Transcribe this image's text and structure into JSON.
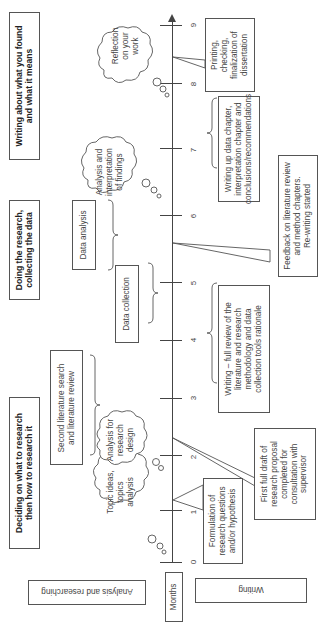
{
  "phases": [
    {
      "label": "Deciding on what to research\nthen how to research it"
    },
    {
      "label": "Doing the research,\ncollecting the data"
    },
    {
      "label": "Writing about what you found\nand what it means"
    }
  ],
  "row_labels": {
    "analysis": "Analysis and researching",
    "months": "Months",
    "writing": "Writing"
  },
  "axis": {
    "ticks": [
      "0",
      "1",
      "2",
      "3",
      "4",
      "5",
      "6",
      "7",
      "8",
      "9"
    ]
  },
  "clouds": [
    {
      "label": "Topic ideas,\ntopics\nanalysis"
    },
    {
      "label": "Analysis for\nresearch\ndesign"
    },
    {
      "label": "Analysis and\ninterpretation\nof findings"
    },
    {
      "label": "Reflection\non your\nwork"
    }
  ],
  "analysis_boxes": [
    {
      "label": "Second literature search\nand literature review"
    },
    {
      "label": "Data collection"
    },
    {
      "label": "Data analysis"
    }
  ],
  "writing_boxes": [
    {
      "label": "Formulation of\nresearch questions\nand/or hypothesis"
    },
    {
      "label": "First full draft of\nresearch proposal\ncompleted for\nconsultation with\nsupervisor"
    },
    {
      "label": "Writing – full review of the\nliterature  and research\nmethodology and data\ncollection tools rationale"
    },
    {
      "label": "Feedback on literature review\nand method chapters.\nRe-writing started"
    },
    {
      "label": "Writing up data chapter,\ninterpretation chapter and\nconclusions/recommendations"
    },
    {
      "label": "Printing,\nchecking,\nfinalization of\ndissertation"
    }
  ]
}
